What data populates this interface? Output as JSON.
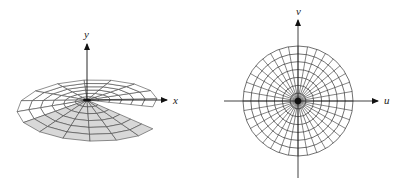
{
  "left_figure": {
    "description": "3D helicoid-like surface (spiral ramp) with polar mesh",
    "axis_labels": {
      "x": "x",
      "y": "y"
    },
    "center": [
      87,
      100
    ],
    "rings": 6,
    "spokes": 16,
    "colors": {
      "mesh": "#444444",
      "shade": "#d8d8d8",
      "shade_dark": "#bdbdbd"
    }
  },
  "right_figure": {
    "description": "Polar grid in the uv-plane (disk)",
    "axis_labels": {
      "u": "u",
      "v": "v"
    },
    "center": [
      298,
      101
    ],
    "radius": 55,
    "rings": 7,
    "spokes": 36,
    "colors": {
      "mesh": "#333333"
    }
  }
}
